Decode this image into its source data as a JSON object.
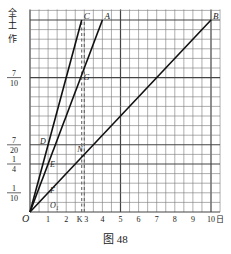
{
  "figure": {
    "caption": "图  48",
    "y_axis_label": [
      "全",
      "工",
      "作"
    ],
    "x_axis_unit": "日",
    "origin_label": "O"
  },
  "chart_data": {
    "type": "line",
    "title": "图 48",
    "xlabel": "日",
    "ylabel": "全工作",
    "xlim": [
      0,
      10.5
    ],
    "ylim": [
      0,
      1.05
    ],
    "grid": true,
    "x_ticks": [
      {
        "v": 1,
        "label": "1"
      },
      {
        "v": 2,
        "label": "2"
      },
      {
        "v": 2.857,
        "label": "K"
      },
      {
        "v": 3,
        "label": "3"
      },
      {
        "v": 4,
        "label": "4"
      },
      {
        "v": 5,
        "label": "5"
      },
      {
        "v": 6,
        "label": "6"
      },
      {
        "v": 7,
        "label": "7"
      },
      {
        "v": 8,
        "label": "8"
      },
      {
        "v": 9,
        "label": "9"
      },
      {
        "v": 10,
        "label": "10"
      }
    ],
    "y_ticks": [
      {
        "v": 0.1,
        "num": "1",
        "den": "10"
      },
      {
        "v": 0.25,
        "num": "1",
        "den": "4"
      },
      {
        "v": 0.35,
        "num": "7",
        "den": "20"
      },
      {
        "v": 0.7,
        "num": "7",
        "den": "10"
      },
      {
        "v": 1,
        "num": "1",
        "den": ""
      }
    ],
    "series": [
      {
        "name": "OC",
        "end_label": "C",
        "x": [
          0,
          2.857
        ],
        "y": [
          0,
          1
        ]
      },
      {
        "name": "OA",
        "end_label": "A",
        "x": [
          0,
          4
        ],
        "y": [
          0,
          1
        ]
      },
      {
        "name": "OB",
        "end_label": "B",
        "x": [
          0,
          10
        ],
        "y": [
          0,
          1
        ]
      }
    ],
    "dashed_verticals": [
      2.857,
      3
    ],
    "point_labels": [
      {
        "label": "G",
        "x": 2.857,
        "y": 0.7
      },
      {
        "label": "D",
        "x": 1.0,
        "y": 0.35
      },
      {
        "label": "E",
        "x": 1.0,
        "y": 0.25
      },
      {
        "label": "N",
        "x": 3.0,
        "y": 0.3
      },
      {
        "label": "F",
        "x": 1.0,
        "y": 0.1
      },
      {
        "label": "O₁",
        "x": 1.0,
        "y": 0.03
      }
    ]
  }
}
